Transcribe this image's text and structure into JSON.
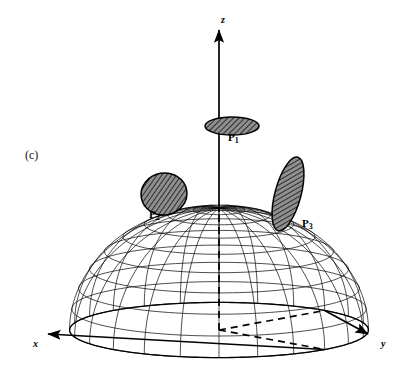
{
  "figure": {
    "panel_label": "(c)",
    "background_color": "#ffffff",
    "line_color": "#000000",
    "patch_fill_color": "#8c8c8c",
    "hatch_color": "#1a1a1a",
    "width": 411,
    "height": 368
  },
  "axes": [
    {
      "name": "z",
      "label": "z",
      "label_x": 221,
      "label_y": 14,
      "kind": "vertical-up"
    },
    {
      "name": "x",
      "label": "x",
      "label_x": 33,
      "label_y": 338,
      "kind": "down-left"
    },
    {
      "name": "y",
      "label": "y",
      "label_x": 381,
      "label_y": 338,
      "kind": "down-right"
    }
  ],
  "patches": [
    {
      "name": "P1",
      "label": "P",
      "subscript": "1",
      "label_x": 232,
      "label_y": 136,
      "cx": 232,
      "cy": 126,
      "rx": 27,
      "ry": 9,
      "rotation": 0,
      "position": "north pole / top of hemisphere"
    },
    {
      "name": "P2",
      "label": "P",
      "subscript": "2",
      "label_x": 152,
      "label_y": 212,
      "cx": 164,
      "cy": 194,
      "rx": 23,
      "ry": 21,
      "rotation": -10,
      "position": "left front face of hemisphere"
    },
    {
      "name": "P3",
      "label": "P",
      "subscript": "3",
      "label_x": 305,
      "label_y": 221,
      "cx": 288,
      "cy": 194,
      "rx": 13,
      "ry": 38,
      "rotation": 15,
      "position": "right front face of hemisphere"
    }
  ],
  "sphere": {
    "center_x": 219,
    "center_y": 330,
    "radius": 122,
    "squash": 0.32,
    "meridian_count": 24,
    "parallel_count": 9
  },
  "chart_data": {
    "type": "diagram",
    "coordinate_axes": [
      "x",
      "y",
      "z"
    ],
    "patch_names": [
      "P1",
      "P2",
      "P3"
    ],
    "grid": true,
    "legend": "none"
  }
}
